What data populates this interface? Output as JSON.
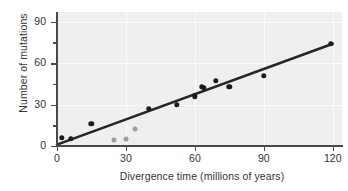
{
  "chart_data": {
    "type": "scatter",
    "title": "",
    "xlabel": "Divergence time (millions of years)",
    "ylabel": "Number of mutations",
    "xlim": [
      0,
      124
    ],
    "ylim": [
      0,
      97
    ],
    "xticks": [
      0,
      30,
      60,
      90,
      120
    ],
    "yticks": [
      0,
      30,
      60,
      90
    ],
    "y_minor_ticks": [
      15,
      45,
      75
    ],
    "grid": true,
    "legend": "none",
    "series": [
      {
        "name": "primary-observations",
        "color": "#1c1c1c",
        "marker": "filled-circle",
        "points": [
          {
            "x": 2,
            "y": 6
          },
          {
            "x": 6,
            "y": 5
          },
          {
            "x": 15,
            "y": 16
          },
          {
            "x": 40,
            "y": 27
          },
          {
            "x": 52,
            "y": 30
          },
          {
            "x": 60,
            "y": 36
          },
          {
            "x": 63,
            "y": 43
          },
          {
            "x": 64,
            "y": 42
          },
          {
            "x": 69,
            "y": 47
          },
          {
            "x": 75,
            "y": 43
          },
          {
            "x": 90,
            "y": 51
          },
          {
            "x": 119,
            "y": 74
          }
        ]
      },
      {
        "name": "secondary-observations",
        "color": "#9d9d9d",
        "marker": "filled-circle",
        "points": [
          {
            "x": 25,
            "y": 4
          },
          {
            "x": 30,
            "y": 5
          },
          {
            "x": 34,
            "y": 12
          }
        ]
      }
    ],
    "trendline": {
      "name": "best-fit-line",
      "color": "#262626",
      "x_start": 0,
      "y_start": 1,
      "x_end": 120,
      "y_end": 74
    }
  },
  "axes": {
    "y_title": "Number of mutations",
    "x_title": "Divergence time (millions of years)",
    "y_tick_labels": [
      "0",
      "30",
      "60",
      "90"
    ],
    "x_tick_labels": [
      "0",
      "30",
      "60",
      "90",
      "120"
    ]
  },
  "colors": {
    "plot_background": "#efefef",
    "gridline": "#fbfbfb",
    "axis": "#4a4a4a",
    "text": "#333333",
    "primary_point": "#1c1c1c",
    "secondary_point": "#9d9d9d",
    "trendline": "#262626"
  }
}
